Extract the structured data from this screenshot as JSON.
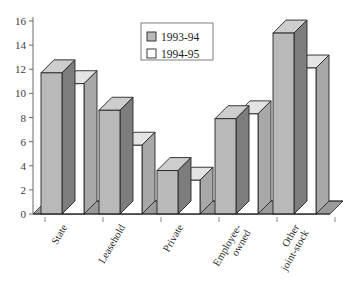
{
  "chart_data": {
    "type": "bar",
    "title": "",
    "subtitle": "",
    "xlabel": "",
    "ylabel": "",
    "ylim": [
      0,
      16
    ],
    "ytick_step": 2,
    "yticks": [
      "0",
      "2",
      "4",
      "6",
      "8",
      "10",
      "12",
      "14",
      "16"
    ],
    "grid": false,
    "legend_position": "top-center",
    "style": "3d-clustered-bar",
    "categories": [
      "State",
      "Leasehold",
      "Private",
      "Employee-owned",
      "Other joint-stock"
    ],
    "category_lines": [
      [
        "State"
      ],
      [
        "Leasehold"
      ],
      [
        "Private"
      ],
      [
        "Employee-",
        "owned"
      ],
      [
        "Other",
        "joint-stock"
      ]
    ],
    "series": [
      {
        "name": "1993-94",
        "color": "#b9b9b9",
        "values": [
          11.7,
          8.6,
          3.6,
          7.9,
          15.0
        ]
      },
      {
        "name": "1994-95",
        "color": "#ffffff",
        "values": [
          10.8,
          5.7,
          2.8,
          8.3,
          12.1
        ]
      }
    ]
  },
  "legend": {
    "entries": [
      {
        "label": "1993-94",
        "swatch": "#b9b9b9"
      },
      {
        "label": "1994-95",
        "swatch": "#ffffff"
      }
    ]
  },
  "colors": {
    "bar_front_gray": "#b9b9b9",
    "bar_front_white": "#ffffff",
    "bar_side_gray": "#7d7d7d",
    "bar_side_white": "#a8a8a8",
    "bar_top_gray": "#cdcdcd",
    "bar_top_white": "#e4e4e4",
    "outline": "#262626",
    "axis": "#6b6b6b",
    "floor": "#9a9a9a",
    "text": "#2b2b2b",
    "background": "#ffffff"
  }
}
